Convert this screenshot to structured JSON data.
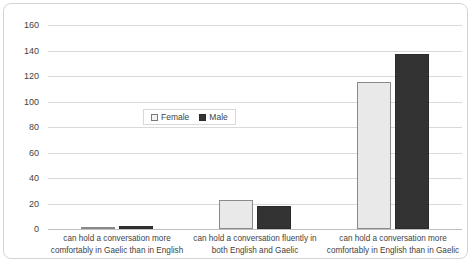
{
  "chart_data": {
    "type": "bar",
    "title": "",
    "subtitle": "",
    "xlabel": "",
    "ylabel": "Number of respondents",
    "ylim": [
      0,
      160
    ],
    "ytick_step": 20,
    "yticks": [
      "160",
      "140",
      "120",
      "100",
      "80",
      "60",
      "40",
      "20",
      "0"
    ],
    "ytick_values": [
      160,
      140,
      120,
      100,
      80,
      60,
      40,
      20,
      0
    ],
    "grid": "horizontal",
    "legend_position": "inside-upper-left-center",
    "categories": [
      "can hold a conversation more comfortably in Gaelic than in English",
      "can hold a conversation fluently in both English and Gaelic",
      "can hold a conversation more comfortably in English than in Gaelic"
    ],
    "series": [
      {
        "name": "Female",
        "values": [
          1,
          23,
          115
        ],
        "color": "#e9e9e9",
        "border_color": "#8a8a8a"
      },
      {
        "name": "Male",
        "values": [
          2,
          18,
          137
        ],
        "color": "#333333",
        "border_color": "#2b2b2b"
      }
    ]
  },
  "legend": {
    "entries": [
      {
        "label": "Female",
        "swatch": "female-swatch-icon"
      },
      {
        "label": "Male",
        "swatch": "male-swatch-icon"
      }
    ]
  },
  "colors": {
    "female": "#e9e9e9",
    "male": "#333333",
    "gridline": "#d9d9d9",
    "axis": "#bfbfbf",
    "text": "#3f3f3f",
    "frame": "#d4d4d4"
  }
}
